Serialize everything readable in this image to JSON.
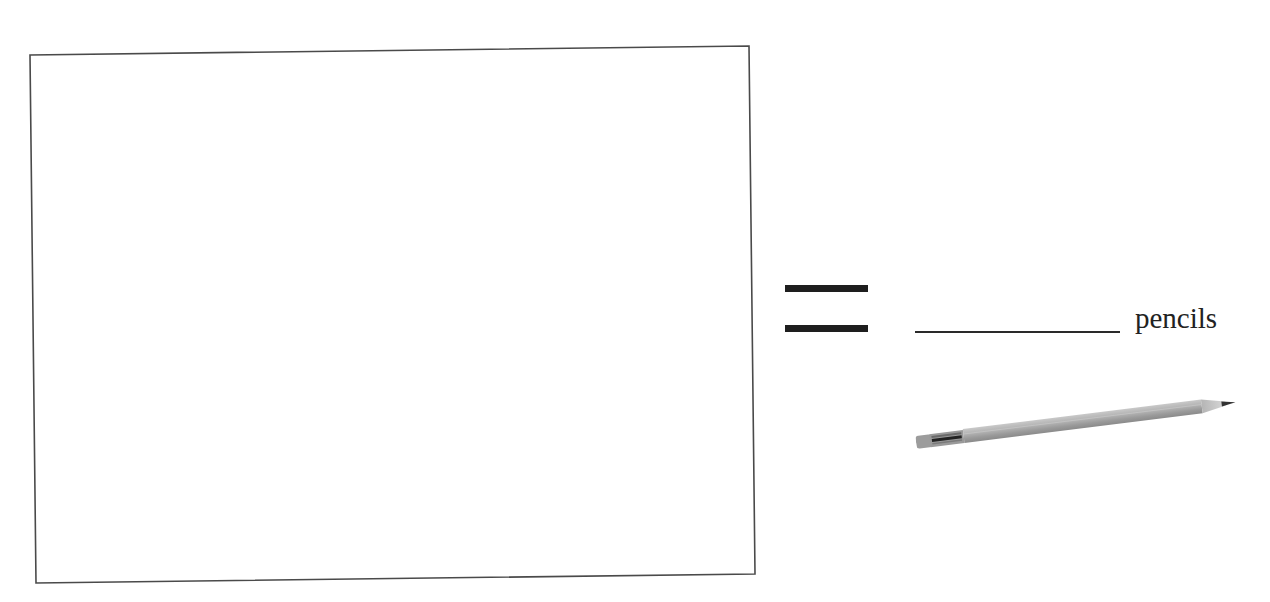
{
  "worksheet": {
    "drawing_box": {
      "label": "",
      "border_color": "#4a4a4a"
    },
    "equation": {
      "operator": "=",
      "answer_blank": "",
      "unit_label": "pencils"
    },
    "pencil_image": {
      "icon": "pencil-icon",
      "body_color": "#a9a9a9",
      "tip_color": "#333333",
      "ferrule_color": "#8a8a8a"
    }
  }
}
